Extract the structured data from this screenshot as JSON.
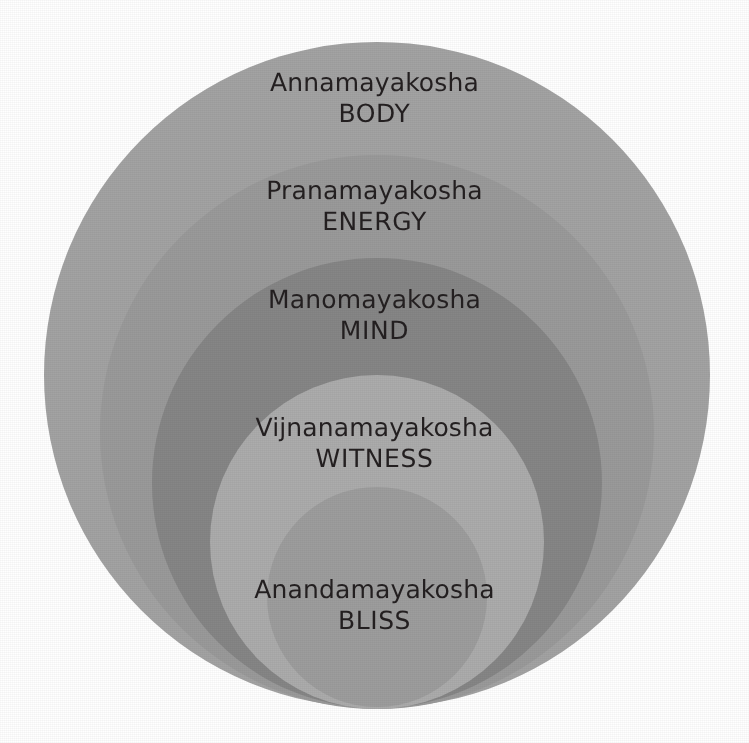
{
  "diagram": {
    "type": "nested-circles",
    "background_color": "#ffffff",
    "text_color": "#231f20",
    "canvas": {
      "width": 749,
      "height": 743
    },
    "layers": [
      {
        "index": 0,
        "sanskrit": "Annamayakosha",
        "english": "BODY",
        "fill": "#a3a3a3",
        "cx": 377,
        "cy": 375,
        "r": 333
      },
      {
        "index": 1,
        "sanskrit": "Pranamayakosha",
        "english": "ENERGY",
        "fill": "#9a9a9a",
        "cx": 377,
        "cy": 432,
        "r": 277
      },
      {
        "index": 2,
        "sanskrit": "Manomayakosha",
        "english": "MIND",
        "fill": "#868686",
        "cx": 377,
        "cy": 483,
        "r": 225
      },
      {
        "index": 3,
        "sanskrit": "Vijnanamayakosha",
        "english": "WITNESS",
        "fill": "#acacac",
        "cx": 377,
        "cy": 542,
        "r": 167
      },
      {
        "index": 4,
        "sanskrit": "Anandamayakosha",
        "english": "BLISS",
        "fill": "#9d9d9d",
        "cx": 377,
        "cy": 597,
        "r": 110
      }
    ]
  }
}
